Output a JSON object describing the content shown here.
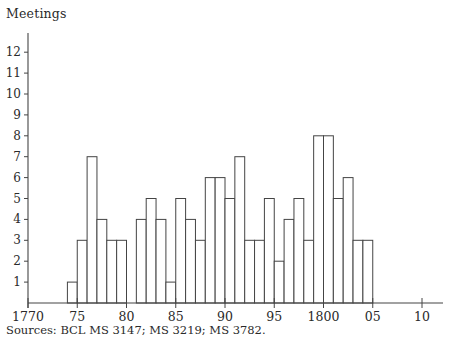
{
  "chart_data": {
    "type": "bar",
    "title": "",
    "ylabel": "Meetings",
    "xlabel": "",
    "x_unit": "year",
    "bar_width_years": 1,
    "categories": [
      1774,
      1775,
      1776,
      1777,
      1778,
      1779,
      1780,
      1781,
      1782,
      1783,
      1784,
      1785,
      1786,
      1787,
      1788,
      1789,
      1790,
      1791,
      1792,
      1793,
      1794,
      1795,
      1796,
      1797,
      1798,
      1799,
      1800,
      1801,
      1802,
      1803,
      1804
    ],
    "values": [
      1,
      3,
      7,
      4,
      3,
      3,
      0,
      4,
      5,
      4,
      1,
      5,
      4,
      3,
      6,
      6,
      5,
      7,
      3,
      3,
      5,
      2,
      4,
      5,
      3,
      8,
      8,
      5,
      6,
      3,
      3
    ],
    "xlim": [
      1770,
      1812
    ],
    "ylim": [
      0,
      13
    ],
    "x_ticks": [
      1770,
      1775,
      1780,
      1785,
      1790,
      1795,
      1800,
      1805,
      1810
    ],
    "x_tick_labels": [
      "1770",
      "75",
      "80",
      "85",
      "90",
      "95",
      "1800",
      "05",
      "10"
    ],
    "y_ticks": [
      1,
      2,
      3,
      4,
      5,
      6,
      7,
      8,
      9,
      10,
      11,
      12
    ],
    "y_tick_labels": [
      "1",
      "2",
      "3",
      "4",
      "5",
      "6",
      "7",
      "8",
      "9",
      "10",
      "11",
      "12"
    ],
    "grid": false,
    "legend": null,
    "bar_fill": "#ffffff",
    "bar_stroke": "#444444",
    "axis_color": "#444444",
    "source_note": "Sources: BCL MS 3147; MS 3219; MS 3782."
  },
  "labels": {
    "y_axis_title": "Meetings",
    "sources": "Sources: BCL MS 3147; MS 3219; MS 3782."
  }
}
